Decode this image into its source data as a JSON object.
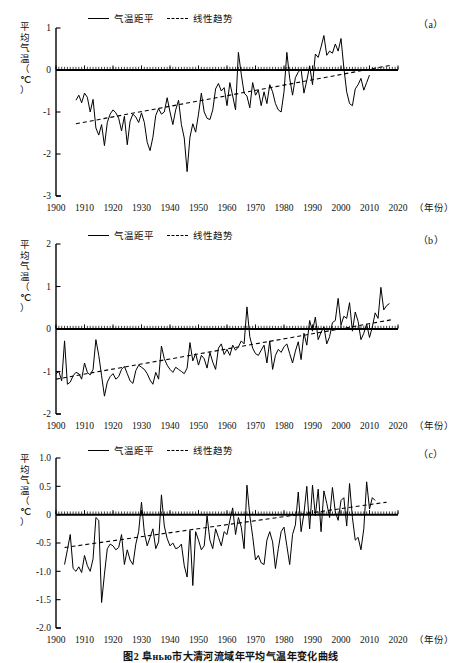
{
  "figure": {
    "caption": "图2  阜нью市大清河流域年平均气温年变化曲线",
    "year_axis_label": "（年份）",
    "y_axis_title_chars": [
      "平",
      "均",
      "气",
      "温",
      "（",
      "℃",
      "）"
    ]
  },
  "legend": {
    "series_label": "气温距平",
    "trend_label": "线性趋势"
  },
  "panels": [
    {
      "key": "a",
      "label": "（a）"
    },
    {
      "key": "b",
      "label": "（b）"
    },
    {
      "key": "c",
      "label": "（c）"
    }
  ],
  "chart_data": [
    {
      "type": "line",
      "panel": "a",
      "title": "",
      "xlabel": "（年份）",
      "ylabel": "平均气温（℃）",
      "xlim": [
        1900,
        2020
      ],
      "ylim": [
        -3,
        1
      ],
      "xticks": [
        1900,
        1910,
        1920,
        1930,
        1940,
        1950,
        1960,
        1970,
        1980,
        1990,
        2000,
        2010,
        2020
      ],
      "yticks": [
        1,
        0,
        -1,
        -2,
        -3
      ],
      "ytick_labels": [
        "1",
        "0",
        "-1",
        "-2",
        "-3"
      ],
      "grid": false,
      "legend_position": "top-left",
      "zero_line": 0,
      "series": [
        {
          "name": "气温距平",
          "style": "solid",
          "x_start": 1907,
          "values": [
            -0.72,
            -0.6,
            -0.78,
            -0.55,
            -0.65,
            -1.0,
            -0.7,
            -1.38,
            -1.55,
            -1.3,
            -1.8,
            -1.25,
            -1.05,
            -0.95,
            -1.02,
            -1.15,
            -1.45,
            -1.1,
            -1.78,
            -1.22,
            -1.05,
            -1.12,
            -1.25,
            -1.02,
            -1.25,
            -1.72,
            -1.92,
            -1.6,
            -1.08,
            -0.92,
            -1.05,
            -1.0,
            -0.66,
            -1.0,
            -1.3,
            -0.95,
            -0.72,
            -1.3,
            -1.62,
            -2.42,
            -1.6,
            -1.28,
            -1.48,
            -1.05,
            -0.55,
            -1.0,
            -1.15,
            -1.18,
            -0.95,
            -0.45,
            -0.32,
            -0.5,
            -0.42,
            -0.85,
            -0.3,
            -0.62,
            -0.95,
            0.42,
            -0.1,
            -0.55,
            -0.62,
            -0.9,
            -0.3,
            -0.6,
            -0.48,
            -0.85,
            -0.52,
            -0.8,
            -0.35,
            -0.52,
            -0.8,
            -0.95,
            -1.0,
            -0.52,
            0.42,
            -0.2,
            -0.6,
            -0.18,
            -0.05,
            0.02,
            -0.55,
            -0.25,
            0.1,
            -0.35,
            0.38,
            0.3,
            0.55,
            0.82,
            0.35,
            0.45,
            0.4,
            0.62,
            0.45,
            0.75,
            0.05,
            -0.52,
            -0.8,
            -0.85,
            -0.45,
            -0.35,
            -0.2,
            -0.48,
            -0.3,
            -0.12
          ]
        },
        {
          "name": "线性趋势",
          "style": "dashed",
          "x_start": 1907,
          "y_start": -1.28,
          "x_end": 2018,
          "y_end": 0.12
        }
      ]
    },
    {
      "type": "line",
      "panel": "b",
      "title": "",
      "xlabel": "（年份）",
      "ylabel": "平均气温（℃）",
      "xlim": [
        1900,
        2020
      ],
      "ylim": [
        -2,
        2
      ],
      "xticks": [
        1900,
        1910,
        1920,
        1930,
        1940,
        1950,
        1960,
        1970,
        1980,
        1990,
        2000,
        2010,
        2020
      ],
      "yticks": [
        2,
        1,
        0,
        -1,
        -2
      ],
      "ytick_labels": [
        "2",
        "1",
        "0",
        "-1",
        "-2"
      ],
      "grid": false,
      "legend_position": "top-left",
      "zero_line": 0,
      "series": [
        {
          "name": "气温距平",
          "style": "solid",
          "x_start": 1900,
          "values": [
            -1.05,
            -1.0,
            -1.22,
            -0.28,
            -1.3,
            -1.25,
            -1.1,
            -1.02,
            -1.05,
            -1.18,
            -0.8,
            -1.02,
            -1.08,
            -0.95,
            -0.25,
            -0.62,
            -1.1,
            -1.58,
            -1.25,
            -1.12,
            -1.05,
            -1.18,
            -1.12,
            -0.95,
            -0.88,
            -1.05,
            -1.22,
            -1.28,
            -0.98,
            -0.85,
            -0.9,
            -0.95,
            -1.05,
            -1.2,
            -1.3,
            -1.02,
            -1.18,
            -0.4,
            -0.7,
            -0.85,
            -0.95,
            -1.02,
            -0.9,
            -0.95,
            -1.0,
            -1.05,
            -0.92,
            -0.32,
            -0.75,
            -0.58,
            -0.85,
            -0.62,
            -0.7,
            -0.92,
            -0.55,
            -0.78,
            -0.95,
            -0.45,
            -0.35,
            -0.6,
            -0.48,
            -0.62,
            -0.38,
            -0.5,
            -0.42,
            -0.28,
            -0.35,
            0.52,
            -0.18,
            -0.45,
            -0.58,
            -0.62,
            -0.5,
            -0.38,
            -0.8,
            -0.28,
            -0.95,
            -0.62,
            -0.48,
            -0.55,
            -0.42,
            -0.35,
            -0.58,
            -0.8,
            -0.52,
            -0.3,
            -0.72,
            -0.1,
            -0.38,
            0.2,
            -0.05,
            0.28,
            -0.25,
            -0.08,
            0.05,
            -0.35,
            -0.18,
            0.15,
            0.2,
            0.72,
            0.1,
            0.3,
            0.25,
            0.62,
            -0.05,
            0.4,
            0.18,
            -0.25,
            -0.1,
            0.12,
            -0.2,
            0.05,
            0.38,
            0.25,
            0.98,
            0.45,
            0.55,
            0.6
          ]
        },
        {
          "name": "线性趋势",
          "style": "dashed",
          "x_start": 1900,
          "y_start": -1.18,
          "x_end": 2018,
          "y_end": 0.22
        }
      ]
    },
    {
      "type": "line",
      "panel": "c",
      "title": "",
      "xlabel": "（年份）",
      "ylabel": "平均气温（℃）",
      "xlim": [
        1900,
        2020
      ],
      "ylim": [
        -2.0,
        1.0
      ],
      "xticks": [
        1900,
        1910,
        1920,
        1930,
        1940,
        1950,
        1960,
        1970,
        1980,
        1990,
        2000,
        2010,
        2020
      ],
      "yticks": [
        1.0,
        0.5,
        0,
        -0.5,
        -1.0,
        -1.5,
        -2.0
      ],
      "ytick_labels": [
        "1.0",
        "0.5",
        "0",
        "-0.5",
        "-1.0",
        "-1.5",
        "-2.0"
      ],
      "grid": false,
      "legend_position": "top-left",
      "zero_line": 0,
      "series": [
        {
          "name": "气温距平",
          "style": "solid",
          "x_start": 1903,
          "values": [
            -0.88,
            -0.62,
            -0.35,
            -0.95,
            -1.0,
            -0.92,
            -1.02,
            -0.72,
            -0.9,
            -1.0,
            -0.78,
            -0.05,
            -0.1,
            -1.55,
            -1.05,
            -0.6,
            -0.52,
            -0.55,
            -0.62,
            -0.58,
            -0.35,
            -0.88,
            -0.62,
            -0.8,
            -0.88,
            -0.52,
            -0.3,
            0.22,
            -0.32,
            -0.55,
            -0.4,
            -0.25,
            -0.6,
            -0.48,
            0.35,
            -0.2,
            -0.42,
            -0.55,
            -0.5,
            -0.6,
            -0.58,
            -0.52,
            -0.9,
            -1.1,
            -0.28,
            -1.25,
            -0.3,
            -0.45,
            -0.62,
            -0.55,
            -0.02,
            -0.45,
            -0.6,
            -0.25,
            -0.4,
            -0.55,
            -0.3,
            -0.35,
            -0.1,
            0.12,
            -0.35,
            -0.05,
            -0.22,
            -0.6,
            0.52,
            -0.02,
            -0.38,
            -0.8,
            -0.72,
            -0.85,
            -0.88,
            -0.45,
            -0.3,
            -0.48,
            -0.95,
            -0.6,
            -0.3,
            -0.22,
            -0.55,
            -0.88,
            -0.35,
            -0.18,
            0.4,
            -0.3,
            0.02,
            0.5,
            -0.25,
            0.52,
            -0.02,
            0.45,
            -0.3,
            0.42,
            0.2,
            -0.05,
            0.48,
            0.05,
            -0.1,
            0.25,
            0.3,
            -0.2,
            0.55,
            -0.05,
            -0.45,
            -0.4,
            -0.62,
            -0.25,
            0.58,
            0.1,
            0.3,
            0.25
          ]
        },
        {
          "name": "线性趋势",
          "style": "dashed",
          "x_start": 1903,
          "y_start": -0.58,
          "x_end": 2016,
          "y_end": 0.22
        }
      ]
    }
  ]
}
